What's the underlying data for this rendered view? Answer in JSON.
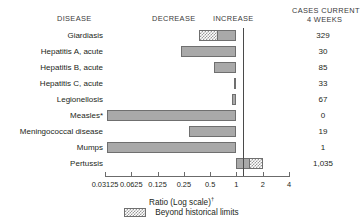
{
  "header": {
    "disease": "DISEASE",
    "decrease": "DECREASE",
    "increase": "INCREASE",
    "cases_line1": "CASES CURRENT",
    "cases_line2": "4 WEEKS"
  },
  "axis": {
    "title": "Ratio (Log scale)",
    "title_footnote": "†",
    "tick_labels": [
      "0.03125",
      "0.0625",
      "0.125",
      "0.25",
      "0.5",
      "1",
      "2",
      "4"
    ],
    "tick_values": [
      0.03125,
      0.0625,
      0.125,
      0.25,
      0.5,
      1,
      2,
      4
    ]
  },
  "legend": {
    "label": "Beyond historical limits",
    "swatch": "hatched-pattern"
  },
  "colors": {
    "bar_fill": "#a9a9a9",
    "bar_border": "#6f6f6f",
    "hatch_fill": "#9a9a9a",
    "axis": "#6b6b6b",
    "zero_line": "#4a4a4a",
    "text": "#231f20"
  },
  "chart_data": {
    "type": "bar",
    "orientation": "horizontal",
    "title": "",
    "xlabel": "Ratio (Log scale)",
    "ylabel": "DISEASE",
    "xscale": "log",
    "xlim": [
      0.03125,
      4
    ],
    "xticks": [
      0.03125,
      0.0625,
      0.125,
      0.25,
      0.5,
      1,
      2,
      4
    ],
    "xticklabels": [
      "0.03125",
      "0.0625",
      "0.125",
      "0.25",
      "0.5",
      "1",
      "2",
      "4"
    ],
    "grid": false,
    "reference_line": 1,
    "legend_position": "bottom-center",
    "legend_entries": [
      "Beyond historical limits"
    ],
    "categories": [
      "Giardiasis",
      "Hepatitis A, acute",
      "Hepatitis B, acute",
      "Hepatitis C, acute",
      "Legionellosis",
      "Measles*",
      "Meningococcal disease",
      "Mumps",
      "Pertussis"
    ],
    "series": [
      {
        "name": "Ratio to historical mean",
        "values": [
          0.37,
          0.23,
          0.55,
          0.93,
          0.88,
          0.033,
          0.29,
          0.033,
          2.0
        ]
      }
    ],
    "cases_current_4_weeks_label": "CASES CURRENT 4 WEEKS",
    "cases_current_4_weeks": [
      "329",
      "30",
      "85",
      "33",
      "67",
      "0",
      "19",
      "1",
      "1,035"
    ],
    "bars": [
      {
        "category": "Giardiasis",
        "ratio": 0.37,
        "direction": "decrease",
        "beyond_historical_limits": true,
        "hatch_fraction": 0.52,
        "cases": "329"
      },
      {
        "category": "Hepatitis A, acute",
        "ratio": 0.23,
        "direction": "decrease",
        "beyond_historical_limits": false,
        "hatch_fraction": 0,
        "cases": "30"
      },
      {
        "category": "Hepatitis B, acute",
        "ratio": 0.55,
        "direction": "decrease",
        "beyond_historical_limits": false,
        "hatch_fraction": 0,
        "cases": "85"
      },
      {
        "category": "Hepatitis C, acute",
        "ratio": 0.93,
        "direction": "decrease",
        "beyond_historical_limits": false,
        "hatch_fraction": 0,
        "cases": "33"
      },
      {
        "category": "Legionellosis",
        "ratio": 0.88,
        "direction": "decrease",
        "beyond_historical_limits": false,
        "hatch_fraction": 0,
        "cases": "67"
      },
      {
        "category": "Measles*",
        "ratio": 0.033,
        "direction": "decrease",
        "beyond_historical_limits": false,
        "hatch_fraction": 0,
        "cases": "0"
      },
      {
        "category": "Meningococcal disease",
        "ratio": 0.29,
        "direction": "decrease",
        "beyond_historical_limits": false,
        "hatch_fraction": 0,
        "cases": "19"
      },
      {
        "category": "Mumps",
        "ratio": 0.033,
        "direction": "decrease",
        "beyond_historical_limits": false,
        "hatch_fraction": 0,
        "cases": "1"
      },
      {
        "category": "Pertussis",
        "ratio": 2.0,
        "direction": "increase",
        "beyond_historical_limits": true,
        "hatch_fraction": 0.5,
        "cases": "1,035"
      }
    ]
  }
}
